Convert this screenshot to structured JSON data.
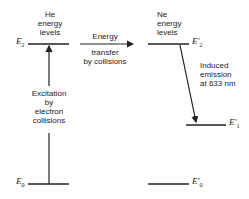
{
  "he": {
    "title_line1": "He",
    "title_line2": "energy",
    "title_line3": "levels",
    "level_top": "E",
    "level_top_sub": "2",
    "level_bottom": "E",
    "level_bottom_sub": "0",
    "excitation_line1": "Excitation",
    "excitation_line2": "by",
    "excitation_line3": "electron",
    "excitation_line4": "collisions"
  },
  "transfer": {
    "label_top": "Energy",
    "label_bottom_line1": "transfer",
    "label_bottom_line2": "by collisions"
  },
  "ne": {
    "title_line1": "Ne",
    "title_line2": "energy",
    "title_line3": "levels",
    "level_top": "E'",
    "level_top_sub": "2",
    "level_mid": "E'",
    "level_mid_sub": "1",
    "level_bottom": "E'",
    "level_bottom_sub": "0",
    "emission_line1": "Induced",
    "emission_line2": "emission",
    "emission_line3": "at 633 nm"
  },
  "colors": {
    "line": "#222222",
    "background": "#ffffff"
  }
}
